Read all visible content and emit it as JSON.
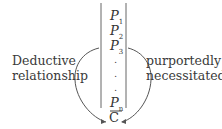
{
  "diagram": {
    "premises": [
      {
        "symbol": "P",
        "subscript": "1"
      },
      {
        "symbol": "P",
        "subscript": "2"
      },
      {
        "symbol": "P",
        "subscript": "3"
      },
      {
        "symbol": "P",
        "subscript": "n"
      }
    ],
    "ellipsis": [
      ".",
      ".",
      "."
    ],
    "conclusion": "C",
    "left_label": [
      "Deductive",
      "relationship"
    ],
    "right_label": [
      "purportedly",
      "necessitated"
    ],
    "colors": {
      "stroke": "#555555",
      "text": "#333333"
    }
  }
}
